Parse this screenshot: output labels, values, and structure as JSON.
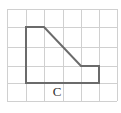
{
  "figure": {
    "label": "C",
    "grid": {
      "x_lines": [
        7,
        26,
        44,
        63,
        81,
        99,
        117
      ],
      "y_lines": [
        9,
        27,
        47,
        66,
        83,
        101
      ],
      "color": "#d0d0d0"
    },
    "shape": {
      "points": "26,27 44,27 81,66 99,66 99,83 26,83",
      "stroke": "#6b6b6b"
    }
  }
}
